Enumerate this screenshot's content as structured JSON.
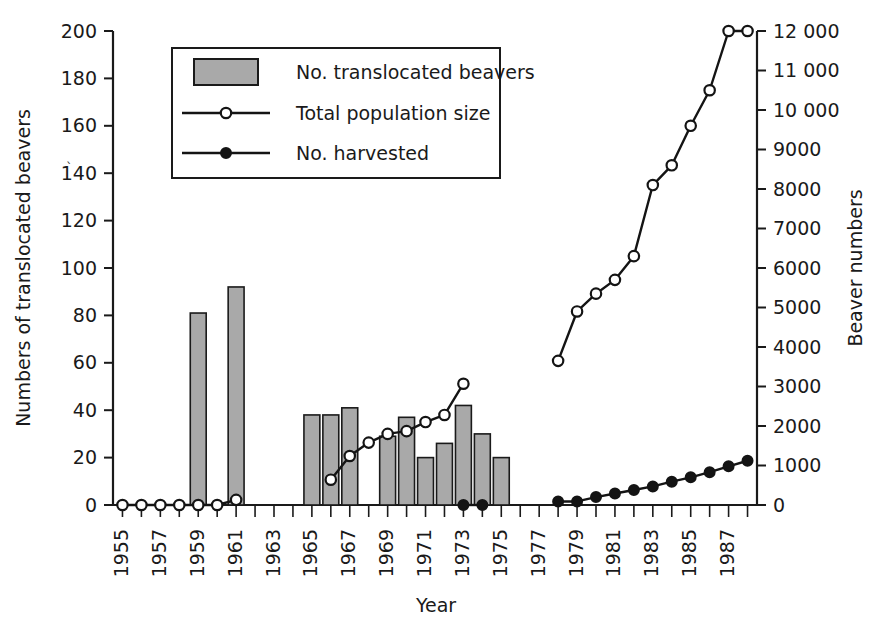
{
  "chart_data": {
    "type": "bar",
    "title": "",
    "xlabel": "Year",
    "ylabel": "Numbers of translocated beavers",
    "y2label": "Beaver numbers",
    "xlim": [
      1954.5,
      1988.5
    ],
    "ylim": [
      0,
      200
    ],
    "y2lim": [
      0,
      12000
    ],
    "grid": false,
    "legend_position": "top-left-inside",
    "x_tick_labels": [
      "1955",
      "1957",
      "1959",
      "1961",
      "1963",
      "1965",
      "1967",
      "1969",
      "1971",
      "1973",
      "1975",
      "1977",
      "1979",
      "1981",
      "1983",
      "1985",
      "1987"
    ],
    "x_tick_years_all": [
      1955,
      1956,
      1957,
      1958,
      1959,
      1960,
      1961,
      1962,
      1963,
      1964,
      1965,
      1966,
      1967,
      1968,
      1969,
      1970,
      1971,
      1972,
      1973,
      1974,
      1975,
      1976,
      1977,
      1978,
      1979,
      1980,
      1981,
      1982,
      1983,
      1984,
      1985,
      1986,
      1987,
      1988
    ],
    "y_tick_labels": [
      "0",
      "20",
      "40",
      "60",
      "80",
      "100",
      "120",
      "140",
      "160",
      "180",
      "200"
    ],
    "y_tick_values": [
      0,
      20,
      40,
      60,
      80,
      100,
      120,
      140,
      160,
      180,
      200
    ],
    "y2_tick_labels": [
      "0",
      "1000",
      "2000",
      "3000",
      "4000",
      "5000",
      "6000",
      "7000",
      "8000",
      "9000",
      "10 000",
      "11 000",
      "12 000"
    ],
    "y2_tick_values": [
      0,
      1000,
      2000,
      3000,
      4000,
      5000,
      6000,
      7000,
      8000,
      9000,
      10000,
      11000,
      12000
    ],
    "series": [
      {
        "name": "No. translocated beavers",
        "type": "bar",
        "axis": "left",
        "color": "#a9a9a9",
        "x": [
          1959,
          1961,
          1965,
          1966,
          1967,
          1969,
          1970,
          1971,
          1972,
          1973,
          1974,
          1975
        ],
        "values": [
          81,
          92,
          38,
          38,
          41,
          29,
          37,
          20,
          26,
          42,
          30,
          20
        ]
      },
      {
        "name": "Total population size",
        "type": "line",
        "axis": "right",
        "marker": "open-circle",
        "x": [
          1955,
          1956,
          1957,
          1958,
          1959,
          1960,
          1961,
          1966,
          1967,
          1968,
          1969,
          1970,
          1971,
          1972,
          1973,
          1978,
          1979,
          1980,
          1981,
          1982,
          1983,
          1984,
          1985,
          1986,
          1987,
          1988
        ],
        "values": [
          0,
          0,
          0,
          0,
          0,
          0,
          130,
          640,
          1240,
          1580,
          1800,
          1870,
          2100,
          2280,
          3070,
          3650,
          4900,
          5350,
          5700,
          6300,
          8100,
          8600,
          9600,
          10500,
          12000,
          12000
        ]
      },
      {
        "name": "No. harvested",
        "type": "line",
        "axis": "right",
        "marker": "filled-circle",
        "x": [
          1973,
          1974,
          1978,
          1979,
          1980,
          1981,
          1982,
          1983,
          1984,
          1985,
          1986,
          1987,
          1988
        ],
        "values": [
          0,
          0,
          90,
          90,
          200,
          290,
          380,
          470,
          590,
          700,
          830,
          980,
          1120
        ]
      }
    ],
    "legend": [
      {
        "label": "No. translocated beavers",
        "marker": "swatch"
      },
      {
        "label": "Total population size",
        "marker": "line-open-circle"
      },
      {
        "label": "No. harvested",
        "marker": "line-filled-circle"
      }
    ]
  }
}
